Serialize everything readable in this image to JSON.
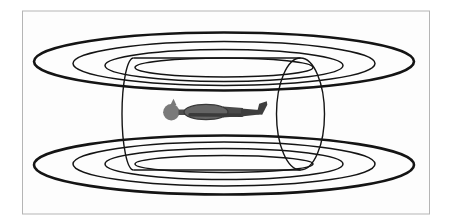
{
  "canvas": {
    "width": 452,
    "height": 224,
    "background": "#ffffff"
  },
  "frame": {
    "x": 22.5,
    "y": 11,
    "width": 407,
    "height": 203,
    "fill": "#fdfdfd",
    "border_color": "#b5b5b5",
    "border_width": 1
  },
  "line_color": "#141414",
  "coils": {
    "top": [
      {
        "cx": 224,
        "cy": 61.5,
        "rx": 190,
        "ry": 29,
        "stroke_width": 2.6
      },
      {
        "cx": 224,
        "cy": 63.5,
        "rx": 151,
        "ry": 22,
        "stroke_width": 1.5
      },
      {
        "cx": 224,
        "cy": 65.5,
        "rx": 119,
        "ry": 16,
        "stroke_width": 1.5
      },
      {
        "cx": 224,
        "cy": 67.5,
        "rx": 89,
        "ry": 9.5,
        "stroke_width": 1.5
      }
    ],
    "bottom": [
      {
        "cx": 224,
        "cy": 165,
        "rx": 190,
        "ry": 29.5,
        "stroke_width": 2.6
      },
      {
        "cx": 224,
        "cy": 164,
        "rx": 151,
        "ry": 22,
        "stroke_width": 1.5
      },
      {
        "cx": 224,
        "cy": 164,
        "rx": 119,
        "ry": 15.5,
        "stroke_width": 1.5
      },
      {
        "cx": 224,
        "cy": 164,
        "rx": 89,
        "ry": 8.5,
        "stroke_width": 1.5
      }
    ]
  },
  "cylinder": {
    "stroke_width": 1.4,
    "right_end": {
      "cx": 300.5,
      "cy": 114,
      "rx": 24,
      "ry": 56
    },
    "left_arc": "M 133.5 58 A 11.5 56 0 0 0 133.5 170",
    "top_line": {
      "x1": 133.5,
      "y1": 58,
      "x2": 300.5,
      "y2": 58
    },
    "bottom_line": {
      "x1": 133.5,
      "y1": 170,
      "x2": 300.5,
      "y2": 170
    }
  },
  "person": {
    "head": {
      "cx": 171.3,
      "cy": 112.3,
      "r": 8.2,
      "fill": "#7a7a7a"
    },
    "nose": {
      "points": "170.3,105.2 173.5,98.8 176.5,105.2",
      "fill": "#7a7a7a"
    },
    "neck": {
      "x": 178.5,
      "y": 109.5,
      "width": 7,
      "height": 5.5,
      "fill": "#4d4d4d"
    },
    "torso": {
      "cx": 206,
      "cy": 112,
      "rx": 22,
      "ry": 7.6,
      "fill": "#646464",
      "stroke": "#383838",
      "stroke_width": 1.2
    },
    "arm": {
      "x1": 190,
      "y1": 114.8,
      "x2": 242,
      "y2": 115.2,
      "stroke": "#3a3a3a",
      "width": 3.5
    },
    "hips": {
      "points": "223,106.5 243,108 243,116 223,117.5",
      "fill": "#4a4a4a"
    },
    "legs": {
      "points": "241,108.5 259.5,110 259.5,114.5 241,116.5",
      "fill": "#3e3e3e"
    },
    "foot": {
      "points": "256.5,114.3 259.2,103.8 266.8,101.3 267.3,104.8 262.2,114.8",
      "fill": "#3e3e3e"
    }
  }
}
